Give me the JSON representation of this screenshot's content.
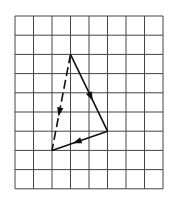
{
  "figure": {
    "grid": {
      "cols": 8,
      "rows": 9,
      "origin_x": 15,
      "origin_y": 16,
      "cell_w": 18.5,
      "cell_h": 19.2,
      "line_color": "#444444"
    },
    "vectors": [
      {
        "name": "vector-a",
        "from": [
          3,
          2
        ],
        "to": [
          5,
          6
        ],
        "style": "solid",
        "arrow_at": 0.55
      },
      {
        "name": "vector-b",
        "from": [
          5,
          6
        ],
        "to": [
          2,
          7
        ],
        "style": "solid",
        "arrow_at": 0.55
      },
      {
        "name": "vector-resultant",
        "from": [
          3,
          2
        ],
        "to": [
          2,
          7
        ],
        "style": "dashed",
        "arrow_at": 0.6
      }
    ],
    "stroke_color": "#111111"
  }
}
